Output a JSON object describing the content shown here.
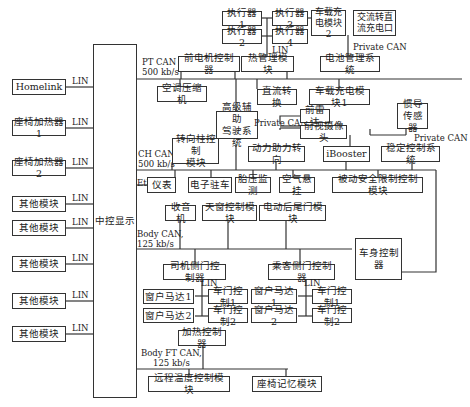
{
  "diagram": {
    "central": {
      "label": "中控显示"
    },
    "left_modules": [
      {
        "label": "Homelink",
        "link": "LIN"
      },
      {
        "label": "座椅加热器1",
        "link": "LIN"
      },
      {
        "label": "座椅加热器2",
        "link": "LIN"
      },
      {
        "label": "其他模块",
        "link": "LIN"
      },
      {
        "label": "其他模块",
        "link": "LIN"
      },
      {
        "label": "其他模块",
        "link": "LIN"
      },
      {
        "label": "其他模块",
        "link": "LIN"
      },
      {
        "label": "其他模块",
        "link": "LIN"
      }
    ],
    "buses": {
      "pt_can": "PT CAN\n500 kb/s",
      "ch_can": "CH CAN\n500 kb/s",
      "eth": "Eth",
      "body_can": "Body CAN,\n125 kb/s",
      "body_ft_can": "Body FT CAN,\n125 kb/s",
      "private_can_1": "Private CAN",
      "private_can_2": "Private CAN",
      "private_can_3": "Private CAN",
      "lin_thermal": "LIN",
      "lin_driver": "LIN",
      "lin_passenger": "LIN"
    },
    "pt_nodes": {
      "actuator1": "执行器1",
      "actuator2": "执行器2",
      "actuator3": "执行器3",
      "actuator4": "执行器4",
      "charger2": "车载充\n电模块2",
      "ac_dc_port": "交流转直\n流充电口",
      "front_motor": "前电机控制器",
      "thermal": "热管理模块",
      "bms": "电池管理系统",
      "ac_compressor": "空调压缩机",
      "dcdc": "直流转换",
      "charger1": "车载充电模块1"
    },
    "ch_nodes": {
      "adas": "高级辅助\n驾驶系统",
      "front_radar": "前雷达",
      "front_camera": "前视摄像头",
      "imu": "惯导\n传感器",
      "steering_column": "转向柱控制\n模块",
      "eps": "动力助力转向",
      "ibooster": "iBooster",
      "esc": "稳定控制系统",
      "cluster": "仪表",
      "epb": "电子驻车",
      "tpms": "胎压监测",
      "air_suspension": "空气悬挂",
      "restraint": "被动安全限制控制模块"
    },
    "body_nodes": {
      "radio": "收音机",
      "sunroof": "天窗控制模块",
      "tailgate": "电动后尾门模块",
      "bcm": "车身控制器",
      "driver_door": "司机侧门控制器",
      "passenger_door": "乘客侧门控制器",
      "d_window1": "窗户马达1",
      "d_window2": "窗户马达2",
      "d_door1": "车门控制1",
      "d_door2": "车门控制2",
      "p_window1": "窗户马达1",
      "p_window2": "窗户马达2",
      "p_door1": "车门控制1",
      "p_door2": "车门控制2"
    },
    "ft_nodes": {
      "heater": "加热控制器",
      "remote_temp": "远程温度控制模块",
      "seat_memory": "座椅记忆模块"
    }
  }
}
